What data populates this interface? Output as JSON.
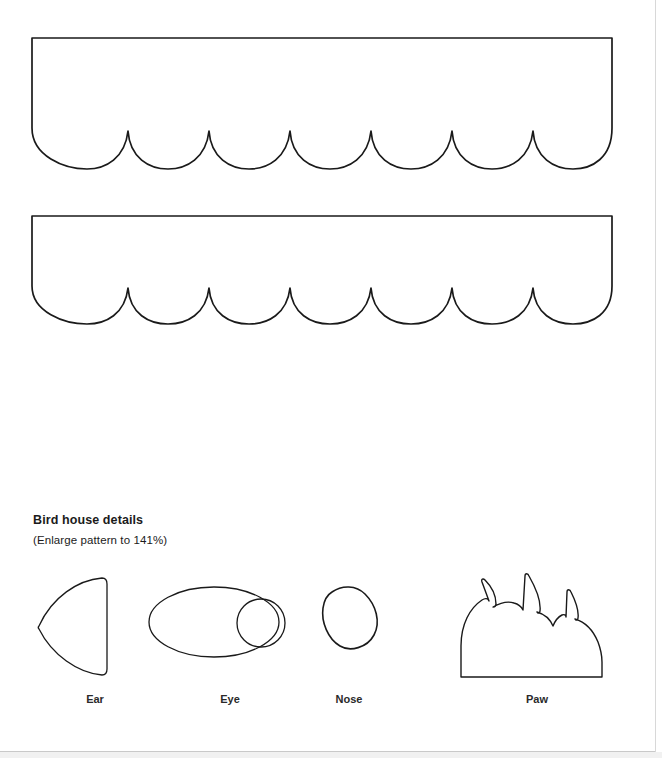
{
  "page": {
    "background_color": "#ffffff",
    "ink_color": "#1a1a1a",
    "edge_color": "#d8d8d8",
    "width": 662,
    "height": 758
  },
  "details_section": {
    "heading": "Bird house details",
    "subheading": "(Enlarge pattern to 141%)"
  },
  "pattern_pieces": [
    {
      "name": "roof-large",
      "shape": "scalloped-rectangle",
      "scallops": 6,
      "width": 588,
      "height": 132
    },
    {
      "name": "roof-small",
      "shape": "scalloped-rectangle",
      "scallops": 6,
      "width": 588,
      "height": 110
    }
  ],
  "detail_pieces": [
    {
      "label": "Ear",
      "shape": "curved-triangle"
    },
    {
      "label": "Eye",
      "shape": "oval-with-pupil-circle"
    },
    {
      "label": "Nose",
      "shape": "rounded-triangle"
    },
    {
      "label": "Paw",
      "shape": "dome-with-three-claws"
    }
  ]
}
